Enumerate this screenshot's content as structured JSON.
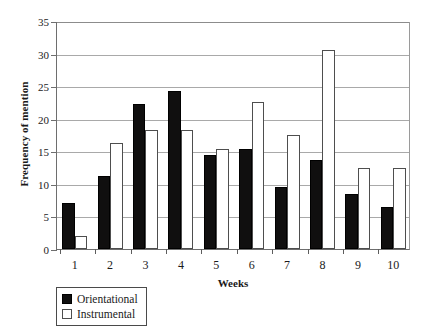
{
  "chart_data": {
    "type": "bar",
    "title": "",
    "xlabel": "Weeks",
    "ylabel": "Frequency of mention",
    "categories": [
      "1",
      "2",
      "3",
      "4",
      "5",
      "6",
      "7",
      "8",
      "9",
      "10"
    ],
    "ylim": [
      0,
      35
    ],
    "yticks": [
      0,
      5,
      10,
      15,
      20,
      25,
      30,
      35
    ],
    "grid": true,
    "legend_position": "below-left",
    "series": [
      {
        "name": "Orientational",
        "color": "#100f0f",
        "values": [
          7.0,
          11.2,
          22.2,
          24.3,
          14.4,
          15.3,
          9.5,
          13.7,
          8.5,
          6.5
        ]
      },
      {
        "name": "Instrumental",
        "color": "#ffffff",
        "values": [
          2.0,
          16.2,
          18.3,
          18.3,
          15.3,
          22.5,
          17.5,
          30.5,
          12.5,
          12.5
        ]
      }
    ]
  },
  "legend": {
    "items": [
      {
        "label": "Orientational",
        "swatch": "filled-black-square"
      },
      {
        "label": "Instrumental",
        "swatch": "open-white-square"
      }
    ]
  },
  "axes": {
    "y_title": "Frequency of mention",
    "x_title": "Weeks"
  }
}
